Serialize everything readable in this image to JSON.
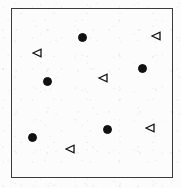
{
  "figure": {
    "width": 181,
    "height": 188,
    "background_color": "#fdfdfd",
    "paper_tint": "#fcfcfc",
    "ink_color": "#1a1a1a",
    "frame": {
      "x": 11,
      "y": 8,
      "width": 162,
      "height": 170,
      "border_width": 1.5,
      "border_color": "#3a3a3a"
    }
  },
  "chart_data": {
    "type": "scatter",
    "title": "",
    "subtitle": "",
    "xlabel": "",
    "ylabel": "",
    "xlim": [
      11,
      173
    ],
    "ylim": [
      8,
      178
    ],
    "grid": false,
    "axis_ticks": false,
    "legend": false,
    "legend_position": "none",
    "series": [
      {
        "name": "filled-circle",
        "marker": "circle",
        "fill": "#111111",
        "stroke": "#111111",
        "size": 9,
        "count": 5,
        "points": [
          {
            "x": 82,
            "y": 37
          },
          {
            "x": 47,
            "y": 81
          },
          {
            "x": 142,
            "y": 68
          },
          {
            "x": 32,
            "y": 137
          },
          {
            "x": 107,
            "y": 129
          }
        ]
      },
      {
        "name": "open-left-triangle",
        "marker": "triangle-left",
        "fill": "none",
        "stroke": "#111111",
        "size": 10,
        "count": 5,
        "points": [
          {
            "x": 37,
            "y": 53
          },
          {
            "x": 156,
            "y": 36
          },
          {
            "x": 103,
            "y": 78
          },
          {
            "x": 150,
            "y": 128
          },
          {
            "x": 70,
            "y": 149
          }
        ]
      }
    ]
  }
}
